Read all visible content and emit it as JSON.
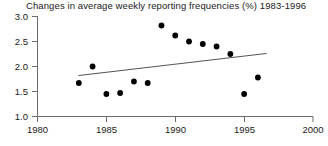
{
  "chart_data": {
    "type": "scatter",
    "title": "Changes in average weekly reporting frequencies (%) 1983-1996",
    "xlabel": "",
    "ylabel": "",
    "xlim": [
      1980,
      2000
    ],
    "ylim": [
      1.0,
      3.0
    ],
    "xticks": [
      1980,
      1985,
      1990,
      1995,
      2000
    ],
    "xtick_labels": [
      "1980",
      "1985",
      "1990",
      "1995",
      "2000"
    ],
    "yticks": [
      1.0,
      1.5,
      2.0,
      2.5,
      3.0
    ],
    "ytick_labels": [
      "1.0",
      "1.5",
      "2.0",
      "2.5",
      "3.0"
    ],
    "grid": false,
    "legend": false,
    "series": [
      {
        "name": "Average weekly reporting frequency",
        "marker": "filled-circle",
        "color": "#000000",
        "x": [
          1983,
          1984,
          1985,
          1986,
          1987,
          1988,
          1989,
          1990,
          1991,
          1992,
          1993,
          1994,
          1995,
          1996
        ],
        "y": [
          1.67,
          2.0,
          1.45,
          1.47,
          1.7,
          1.67,
          2.82,
          2.62,
          2.5,
          2.45,
          2.4,
          2.25,
          1.45,
          1.78
        ]
      }
    ],
    "trendline": {
      "name": "linear trend",
      "color": "#555555",
      "x_start": 1983.0,
      "y_start": 1.82,
      "x_end": 1996.6,
      "y_end": 2.26
    }
  },
  "axes": {
    "y_axis_name": "value-axis",
    "x_axis_name": "year-axis"
  }
}
